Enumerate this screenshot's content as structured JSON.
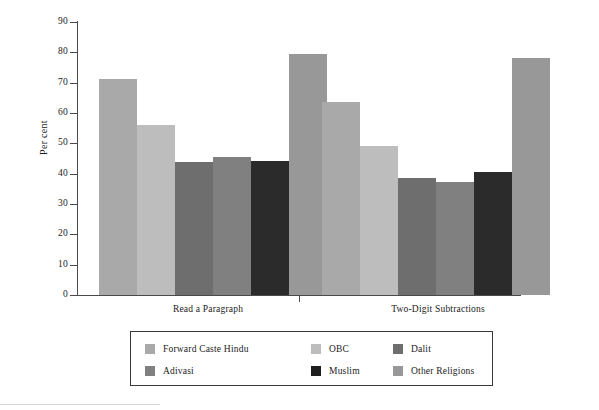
{
  "chart_data": {
    "type": "bar",
    "title": "",
    "xlabel": "",
    "ylabel": "Per cent",
    "ylim": [
      0,
      90
    ],
    "ytick_step": 10,
    "yticks": [
      90,
      80,
      70,
      60,
      50,
      40,
      30,
      20,
      10,
      0
    ],
    "grid": false,
    "legend_position": "bottom",
    "categories": [
      "Read a Paragraph",
      "Two-Digit Subtractions"
    ],
    "series": [
      {
        "name": "Forward Caste Hindu",
        "color": "#a9a9a9",
        "values": [
          71.2,
          63.5
        ]
      },
      {
        "name": "OBC",
        "color": "#bdbdbd",
        "values": [
          56.0,
          49.2
        ]
      },
      {
        "name": "Dalit",
        "color": "#6e6e6e",
        "values": [
          44.0,
          38.5
        ]
      },
      {
        "name": "Adivasi",
        "color": "#808080",
        "values": [
          45.6,
          37.3
        ]
      },
      {
        "name": "Muslim",
        "color": "#2b2b2b",
        "values": [
          44.3,
          40.5
        ]
      },
      {
        "name": "Other Religions",
        "color": "#989898",
        "values": [
          79.4,
          78.0
        ]
      }
    ]
  },
  "axis": {
    "y_title": "Per cent",
    "y_tick_labels": [
      "90",
      "80",
      "70",
      "60",
      "50",
      "40",
      "30",
      "20",
      "10",
      "0"
    ]
  },
  "groups": [
    {
      "label": "Read a Paragraph"
    },
    {
      "label": "Two-Digit Subtractions"
    }
  ],
  "legend": {
    "rows": [
      [
        {
          "label": "Forward Caste Hindu",
          "color": "#a9a9a9"
        },
        {
          "label": "OBC",
          "color": "#bdbdbd"
        },
        {
          "label": "Dalit",
          "color": "#6e6e6e"
        }
      ],
      [
        {
          "label": "Adivasi",
          "color": "#808080"
        },
        {
          "label": "Muslim",
          "color": "#1f1f1f"
        },
        {
          "label": "Other Religions",
          "color": "#989898"
        }
      ]
    ]
  }
}
